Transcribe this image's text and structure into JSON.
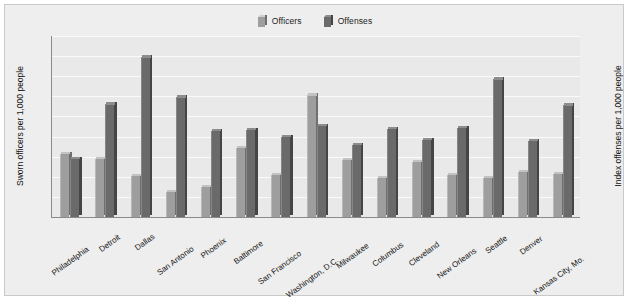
{
  "legend": {
    "items": [
      {
        "label": "Officers",
        "color": "#9e9e9e"
      },
      {
        "label": "Offenses",
        "color": "#6a6a6a"
      }
    ]
  },
  "axes": {
    "left": {
      "title": "Sworn officers per 1,000 people",
      "ticks": [
        "0",
        "1",
        "2",
        "3",
        "4",
        "5",
        "6",
        "7",
        "8",
        "9"
      ],
      "min": 0,
      "max": 9
    },
    "right": {
      "title": "Index offenses per 1,000 people",
      "ticks": [
        "0",
        "20",
        "40",
        "60",
        "80",
        "100",
        "120",
        "140",
        "160",
        "180"
      ],
      "min": 0,
      "max": 180
    }
  },
  "chart_data": {
    "type": "bar",
    "title": "",
    "xlabel": "",
    "ylabel": "Sworn officers per 1,000 people",
    "y2label": "Index offenses per 1,000 people",
    "ylim": [
      0,
      9
    ],
    "y2lim": [
      0,
      180
    ],
    "grid": true,
    "legend_position": "top-center",
    "categories": [
      "Philadelphia",
      "Detroit",
      "Dallas",
      "San Antonio",
      "Phoenix",
      "Baltimore",
      "San Francisco",
      "Washington, D.C.",
      "Milwaukee",
      "Columbus",
      "Cleveland",
      "New Orleans",
      "Seattle",
      "Denver",
      "Kansas City, Mo."
    ],
    "series": [
      {
        "name": "Officers",
        "axis": "left",
        "unit": "sworn officers per 1,000 people",
        "values": [
          3.15,
          2.9,
          2.05,
          1.25,
          1.5,
          3.45,
          2.1,
          6.05,
          2.85,
          1.95,
          2.75,
          2.1,
          1.95,
          2.25,
          2.15
        ]
      },
      {
        "name": "Offenses",
        "axis": "right",
        "unit": "index offenses per 1,000 people",
        "values": [
          58,
          112,
          159,
          119,
          86,
          87,
          80,
          91,
          72,
          88,
          77,
          89,
          137,
          76,
          111
        ]
      }
    ]
  }
}
